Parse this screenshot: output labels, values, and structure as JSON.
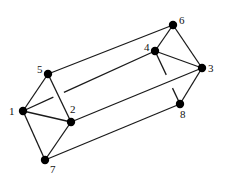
{
  "diagram": {
    "type": "graph",
    "colors": {
      "edge": "#1a1a1a",
      "node": "#000000",
      "background": "#ffffff"
    },
    "nodes": [
      {
        "id": "1",
        "label": "1",
        "x": 23,
        "y": 111,
        "lx": 9,
        "ly": 115
      },
      {
        "id": "2",
        "label": "2",
        "x": 71,
        "y": 122,
        "lx": 70,
        "ly": 113
      },
      {
        "id": "3",
        "label": "3",
        "x": 202,
        "y": 68,
        "lx": 208,
        "ly": 72
      },
      {
        "id": "4",
        "label": "4",
        "x": 155,
        "y": 51,
        "lx": 144,
        "ly": 51
      },
      {
        "id": "5",
        "label": "5",
        "x": 48,
        "y": 74,
        "lx": 37,
        "ly": 73
      },
      {
        "id": "6",
        "label": "6",
        "x": 173,
        "y": 25,
        "lx": 179,
        "ly": 24
      },
      {
        "id": "7",
        "label": "7",
        "x": 45,
        "y": 160,
        "lx": 50,
        "ly": 173
      },
      {
        "id": "8",
        "label": "8",
        "x": 180,
        "y": 104,
        "lx": 180,
        "ly": 118
      }
    ],
    "edges": [
      {
        "from": "5",
        "to": "1"
      },
      {
        "from": "5",
        "to": "2"
      },
      {
        "from": "1",
        "to": "2"
      },
      {
        "from": "1",
        "to": "7"
      },
      {
        "from": "2",
        "to": "7"
      },
      {
        "from": "6",
        "to": "4"
      },
      {
        "from": "6",
        "to": "3"
      },
      {
        "from": "4",
        "to": "3"
      },
      {
        "from": "3",
        "to": "8"
      },
      {
        "from": "5",
        "to": "6"
      },
      {
        "from": "2",
        "to": "3"
      },
      {
        "from": "7",
        "to": "8"
      },
      {
        "from": "1",
        "to": "4",
        "hidden_gap": true
      },
      {
        "from": "4",
        "to": "8",
        "hidden_gap": true
      }
    ]
  }
}
